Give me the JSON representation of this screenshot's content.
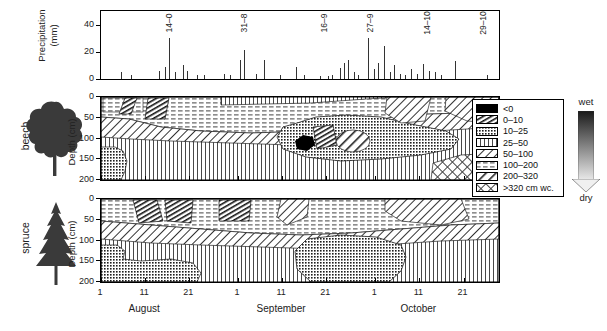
{
  "figure": {
    "title": "",
    "panels": [
      "precipitation",
      "beech",
      "spruce"
    ]
  },
  "precipitation": {
    "y_axis_label_line1": "Precipitation",
    "y_axis_label_line2": "(mm)",
    "y_ticks": [
      "0",
      "20",
      "40"
    ],
    "event_labels": [
      "14–0",
      "31–8",
      "16–9",
      "27–9",
      "14–10",
      "29–10"
    ]
  },
  "beech": {
    "side_label": "beech",
    "y_axis_label": "Depth (cm)",
    "y_ticks": [
      "0",
      "50",
      "100",
      "150",
      "200"
    ],
    "tree_icon": "broadleaf-tree-icon"
  },
  "spruce": {
    "side_label": "spruce",
    "y_axis_label": "Depth (cm)",
    "y_ticks": [
      "0",
      "50",
      "100",
      "150",
      "200"
    ],
    "tree_icon": "conifer-tree-icon"
  },
  "x_axis": {
    "day_ticks": [
      "1",
      "11",
      "21",
      "1",
      "11",
      "21",
      "1",
      "11",
      "21"
    ],
    "months": [
      "August",
      "September",
      "October"
    ]
  },
  "legend": {
    "items": [
      {
        "label": "<0",
        "pattern": "solid-black"
      },
      {
        "label": "0–10",
        "pattern": "steep-diagonal"
      },
      {
        "label": "10–25",
        "pattern": "dotted-grid"
      },
      {
        "label": "25–50",
        "pattern": "vertical-lines"
      },
      {
        "label": "50–100",
        "pattern": "diagonal-lines"
      },
      {
        "label": "100–200",
        "pattern": "horizontal-dashes"
      },
      {
        "label": "200–320",
        "pattern": "wide-diagonal"
      },
      {
        "label": ">320 cm wc.",
        "pattern": "crosshatch"
      }
    ]
  },
  "moisture_scale": {
    "top_label": "wet",
    "bottom_label": "dry",
    "top_color": "#1a1a1a",
    "bottom_color": "#f2f2f2"
  },
  "chart_data": {
    "type": "bar",
    "xlabel": "",
    "ylabel": "Precipitation (mm)",
    "ylim": [
      0,
      50
    ],
    "categories": [
      "Aug 1",
      "Aug 11",
      "Aug 21",
      "Sep 1",
      "Sep 11",
      "Sep 21",
      "Oct 1",
      "Oct 11",
      "Oct 21"
    ],
    "precipitation_bars": [
      {
        "x": 5.0,
        "mm": 5
      },
      {
        "x": 7.5,
        "mm": 3
      },
      {
        "x": 14.5,
        "mm": 6
      },
      {
        "x": 16.0,
        "mm": 9
      },
      {
        "x": 17.0,
        "mm": 30
      },
      {
        "x": 18.5,
        "mm": 5
      },
      {
        "x": 20.5,
        "mm": 10
      },
      {
        "x": 21.5,
        "mm": 6
      },
      {
        "x": 24.0,
        "mm": 3
      },
      {
        "x": 26.0,
        "mm": 3
      },
      {
        "x": 31.0,
        "mm": 4
      },
      {
        "x": 32.5,
        "mm": 3
      },
      {
        "x": 35.0,
        "mm": 14
      },
      {
        "x": 36.0,
        "mm": 21
      },
      {
        "x": 39.0,
        "mm": 4
      },
      {
        "x": 41.0,
        "mm": 14
      },
      {
        "x": 45.0,
        "mm": 3
      },
      {
        "x": 49.0,
        "mm": 9
      },
      {
        "x": 51.0,
        "mm": 3
      },
      {
        "x": 55.0,
        "mm": 2
      },
      {
        "x": 57.0,
        "mm": 2
      },
      {
        "x": 58.0,
        "mm": 3
      },
      {
        "x": 60.0,
        "mm": 8
      },
      {
        "x": 61.0,
        "mm": 12
      },
      {
        "x": 62.0,
        "mm": 14
      },
      {
        "x": 63.5,
        "mm": 5
      },
      {
        "x": 64.5,
        "mm": 3
      },
      {
        "x": 67.0,
        "mm": 30
      },
      {
        "x": 68.5,
        "mm": 7
      },
      {
        "x": 69.5,
        "mm": 12
      },
      {
        "x": 71.0,
        "mm": 24
      },
      {
        "x": 72.5,
        "mm": 5
      },
      {
        "x": 73.5,
        "mm": 10
      },
      {
        "x": 75.0,
        "mm": 4
      },
      {
        "x": 76.5,
        "mm": 3
      },
      {
        "x": 78.0,
        "mm": 7
      },
      {
        "x": 79.5,
        "mm": 4
      },
      {
        "x": 81.0,
        "mm": 11
      },
      {
        "x": 82.5,
        "mm": 6
      },
      {
        "x": 84.0,
        "mm": 5
      },
      {
        "x": 85.5,
        "mm": 3
      },
      {
        "x": 89.0,
        "mm": 13
      },
      {
        "x": 97.0,
        "mm": 3
      }
    ],
    "event_markers": [
      {
        "x": 17.0,
        "label": "14–0"
      },
      {
        "x": 36.0,
        "label": "31–8"
      },
      {
        "x": 56.0,
        "label": "16–9"
      },
      {
        "x": 67.5,
        "label": "27–9"
      },
      {
        "x": 82.0,
        "label": "14–10"
      },
      {
        "x": 96.0,
        "label": "29–10"
      }
    ],
    "depth_profiles": {
      "ylabel": "Depth (cm)",
      "ylim": [
        0,
        200
      ],
      "classes": [
        "<0",
        "0–10",
        "10–25",
        "25–50",
        "50–100",
        "100–200",
        "200–320",
        ">320 cm wc."
      ],
      "units": "cm water column tension"
    }
  }
}
